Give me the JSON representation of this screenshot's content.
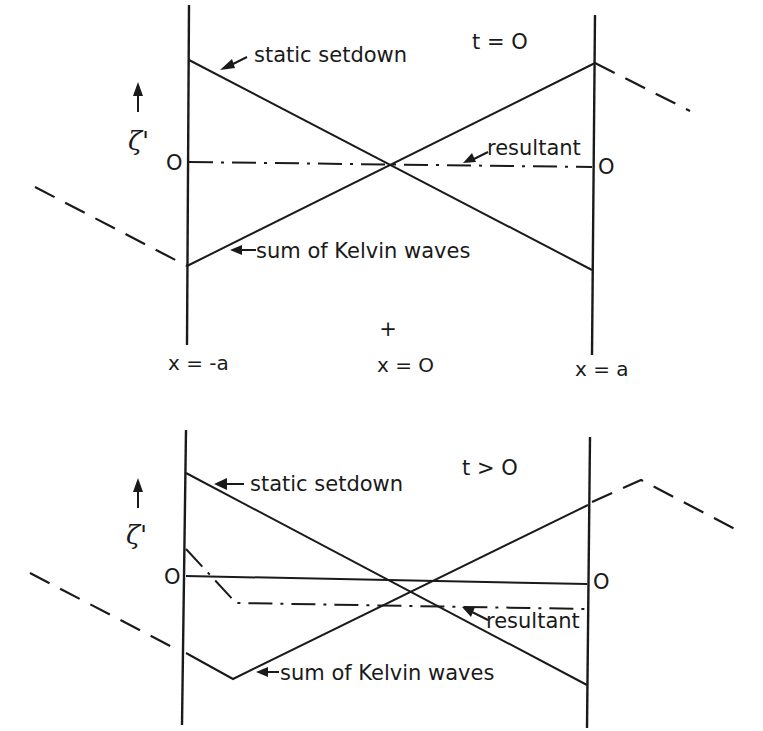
{
  "figure": {
    "background": "#ffffff",
    "ink_color": "#1a1a1a"
  },
  "top_panel": {
    "time_label": "t = O",
    "zeta_label": "ζ'",
    "zero_left": "O",
    "zero_right": "O",
    "x_left_label": "x = -a",
    "x_center_label": "x = O",
    "x_right_label": "x = a",
    "center_marker": "+",
    "labels": {
      "static_setdown": "static setdown",
      "resultant": "resultant",
      "kelvin_sum": "sum of Kelvin waves"
    },
    "walls": {
      "left": [
        [
          189,
          5
        ],
        [
          187,
          345
        ]
      ],
      "right": [
        [
          595,
          15
        ],
        [
          592,
          355
        ]
      ]
    },
    "lines": {
      "static_setdown": [
        [
          189,
          60
        ],
        [
          592,
          270
        ]
      ],
      "kelvin_sum": [
        [
          187,
          266
        ],
        [
          595,
          63
        ]
      ],
      "resultant": [
        [
          189,
          162
        ],
        [
          592,
          167
        ]
      ],
      "dashed_left": [
        [
          35,
          187
        ],
        [
          187,
          266
        ]
      ],
      "dashed_right": [
        [
          595,
          63
        ],
        [
          690,
          111
        ]
      ]
    }
  },
  "bottom_panel": {
    "time_label": "t > O",
    "zeta_label": "ζ'",
    "zero_left": "O",
    "zero_right": "O",
    "labels": {
      "static_setdown": "static setdown",
      "resultant": "resultant",
      "kelvin_sum": "sum of Kelvin waves"
    },
    "walls": {
      "left": [
        [
          186,
          430
        ],
        [
          182,
          725
        ]
      ],
      "right": [
        [
          590,
          437
        ],
        [
          587,
          728
        ]
      ]
    },
    "lines": {
      "static_setdown": [
        [
          186,
          473
        ],
        [
          587,
          685
        ]
      ],
      "zero_line": [
        [
          186,
          576
        ],
        [
          587,
          584
        ]
      ],
      "resultant": [
        [
          186,
          549
        ],
        [
          236,
          603
        ],
        [
          587,
          609
        ]
      ],
      "kelvin_sum": [
        [
          186,
          653
        ],
        [
          233,
          679
        ],
        [
          588,
          505
        ]
      ],
      "dashed_left": [
        [
          30,
          573
        ],
        [
          176,
          649
        ]
      ],
      "dashed_right": [
        [
          592,
          502
        ],
        [
          641,
          480
        ],
        [
          737,
          530
        ]
      ]
    }
  }
}
